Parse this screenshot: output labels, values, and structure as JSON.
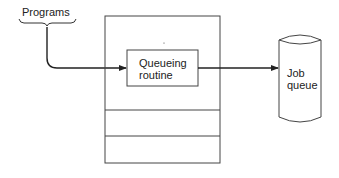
{
  "diagram": {
    "programs_label": "Programs",
    "queueing_routine": [
      "Queueing",
      "routine"
    ],
    "job_queue": [
      "Job",
      "queue"
    ],
    "colors": {
      "stroke": "#333333",
      "background": "#ffffff"
    }
  }
}
